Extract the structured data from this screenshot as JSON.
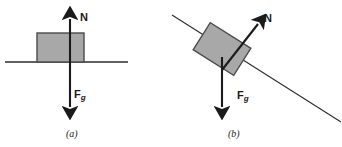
{
  "figure": {
    "width": 342,
    "height": 147,
    "background": "#ffffff",
    "ink_color": "#1b1b1b",
    "block_fill": "#a8a8a8",
    "block_stroke": "#4a4a4a",
    "surface_color": "#2b2b2b"
  },
  "panels": [
    {
      "id": "a",
      "caption": "(a)",
      "description": "Block resting on a horizontal surface",
      "surface": {
        "type": "horizontal-line",
        "x1": 5,
        "y1": 62,
        "x2": 128,
        "y2": 62
      },
      "block": {
        "x": 37,
        "y": 33,
        "width": 47,
        "height": 29,
        "rotation_deg": 0
      },
      "vectors": [
        {
          "name": "N",
          "label": "N",
          "label_sub": "",
          "tail_x": 70,
          "tail_y": 62,
          "tip_x": 70,
          "tip_y": 14,
          "angle_deg": 90
        },
        {
          "name": "Fg",
          "label": "F",
          "label_sub": "g",
          "tail_x": 70,
          "tail_y": 62,
          "tip_x": 70,
          "tip_y": 112,
          "angle_deg": 270
        }
      ]
    },
    {
      "id": "b",
      "caption": "(b)",
      "description": "Block resting on an inclined surface",
      "surface": {
        "type": "inclined-line",
        "x1": 1,
        "y1": 15,
        "x2": 170,
        "y2": 122,
        "incline_angle_deg": 32
      },
      "block": {
        "x": 28,
        "y": 33,
        "width": 47,
        "height": 32,
        "rotation_deg": 32
      },
      "vectors": [
        {
          "name": "N",
          "label": "N",
          "label_sub": "",
          "tail_x": 51,
          "tail_y": 70,
          "tip_x": 92,
          "tip_y": 18,
          "angle_deg": 58
        },
        {
          "name": "Fg",
          "label": "F",
          "label_sub": "g",
          "tail_x": 51,
          "tail_y": 57,
          "tip_x": 51,
          "tip_y": 112,
          "angle_deg": 270
        }
      ]
    }
  ]
}
